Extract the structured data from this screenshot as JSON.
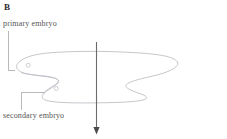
{
  "figure": {
    "panel_letter": "B",
    "type": "line-drawing",
    "background_color": "#ffffff",
    "outline_color": "#b9bcc2",
    "arrow_color": "#6b6b6b",
    "leader_color": "#9a9a9a",
    "label_color": "#555555",
    "panel_letter_color": "#2b2b2b"
  },
  "annotations": [
    {
      "id": "primary-embryo",
      "label": "primary embryo",
      "leader": "vertical line descending from label to upper lobe"
    },
    {
      "id": "secondary-embryo",
      "label": "secondary embryo",
      "leader": "elbow line rising from label to lower lobe"
    }
  ],
  "markers": [
    {
      "id": "primary-embryo-node",
      "shape": "small-circle"
    },
    {
      "id": "secondary-embryo-node",
      "shape": "small-circle"
    }
  ],
  "axis_arrow": {
    "id": "midline-axis-arrow",
    "orientation": "vertical",
    "direction": "downward",
    "head": "solid triangle at bottom"
  }
}
